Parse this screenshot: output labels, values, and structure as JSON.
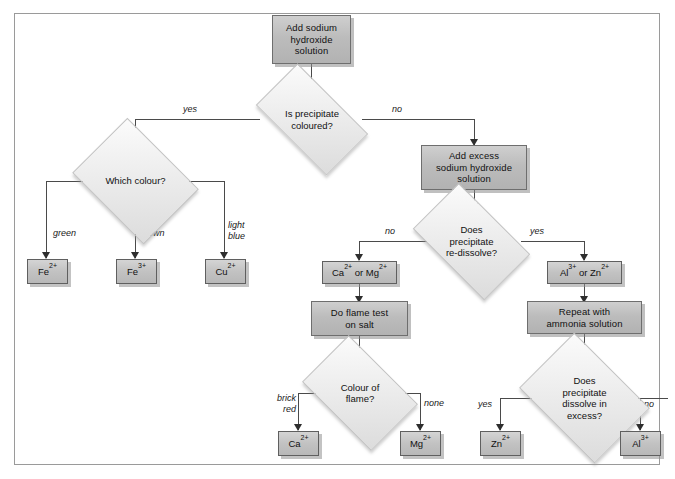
{
  "diagram": {
    "nodes": {
      "start": "Add sodium hydroxide solution",
      "d_coloured": "Is precipitate coloured?",
      "d_which_colour": "Which colour?",
      "r_fe2": "Fe2+",
      "r_fe3": "Fe3+",
      "r_cu2": "Cu2+",
      "p_excess": "Add excess sodium hydroxide solution",
      "d_redissolve": "Does precipitate re-dissolve?",
      "r_ca_mg": "Ca2+ or Mg2+",
      "p_flame": "Do flame test on salt",
      "d_flame_colour": "Colour of flame?",
      "r_ca2": "Ca2+",
      "r_mg2": "Mg2+",
      "r_al_zn": "Al3+ or Zn2+",
      "p_ammonia": "Repeat with ammonia solution",
      "d_dissolve_excess": "Does precipitate dissolve in excess?",
      "r_zn2": "Zn2+",
      "r_al3": "Al3+"
    },
    "node_lines": {
      "start": [
        "Add sodium",
        "hydroxide",
        "solution"
      ],
      "d_coloured": [
        "Is precipitate",
        "coloured?"
      ],
      "d_which_colour": [
        "Which colour?"
      ],
      "p_excess": [
        "Add excess",
        "sodium hydroxide",
        "solution"
      ],
      "d_redissolve": [
        "Does",
        "precipitate",
        "re-dissolve?"
      ],
      "p_flame": [
        "Do flame test",
        "on salt"
      ],
      "d_flame_colour": [
        "Colour of",
        "flame?"
      ],
      "p_ammonia": [
        "Repeat with",
        "ammonia solution"
      ],
      "d_dissolve_excess": [
        "Does",
        "precipitate",
        "dissolve in",
        "excess?"
      ]
    },
    "ion_parts": {
      "fe2": {
        "base": "Fe",
        "sup": "2+"
      },
      "fe3": {
        "base": "Fe",
        "sup": "3+"
      },
      "cu2": {
        "base": "Cu",
        "sup": "2+"
      },
      "ca2": {
        "base": "Ca",
        "sup": "2+"
      },
      "mg2": {
        "base": "Mg",
        "sup": "2+"
      },
      "zn2": {
        "base": "Zn",
        "sup": "2+"
      },
      "al3": {
        "base": "Al",
        "sup": "3+"
      },
      "ca_mg_a": {
        "base": "Ca",
        "sup": "2+"
      },
      "ca_mg_mid": " or ",
      "ca_mg_b": {
        "base": "Mg",
        "sup": "2+"
      },
      "al_zn_a": {
        "base": "Al",
        "sup": "3+"
      },
      "al_zn_mid": " or ",
      "al_zn_b": {
        "base": "Zn",
        "sup": "2+"
      }
    },
    "edge_labels": {
      "coloured_yes": "yes",
      "coloured_no": "no",
      "colour_green": "green",
      "colour_brown": "brown",
      "colour_light_blue_1": "light",
      "colour_light_blue_2": "blue",
      "redissolve_no": "no",
      "redissolve_yes": "yes",
      "flame_brick_1": "brick",
      "flame_brick_2": "red",
      "flame_none": "none",
      "excess_yes": "yes",
      "excess_no": "no"
    },
    "colors": {
      "frame_border": "#9a9a9a",
      "process_fill": "#bcbcbc",
      "decision_fill": "#ededed",
      "line": "#4a4a4a",
      "background": "#ffffff"
    }
  }
}
